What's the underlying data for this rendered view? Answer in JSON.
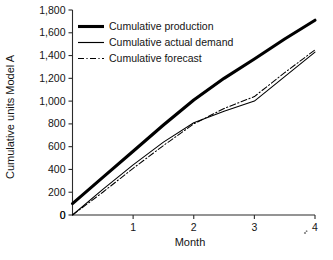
{
  "chart_data": {
    "type": "line",
    "title": "",
    "subtitle": "",
    "xlabel": "Month",
    "ylabel": "Cumulative units Model A",
    "xlim": [
      0,
      4
    ],
    "ylim": [
      0,
      1800
    ],
    "grid": false,
    "legend_position": "top-left-inside",
    "x_ticks": [
      0,
      1,
      2,
      3,
      4
    ],
    "x_tick_labels": [
      "0",
      "1",
      "2",
      "3",
      "4"
    ],
    "y_ticks": [
      0,
      200,
      400,
      600,
      800,
      1000,
      1200,
      1400,
      1600,
      1800
    ],
    "y_tick_labels": [
      "0",
      "200",
      "400",
      "600",
      "800",
      "1,000",
      "1,200",
      "1,400",
      "1,600",
      "1,800"
    ],
    "x": [
      0,
      0.5,
      1,
      1.5,
      2,
      2.5,
      3,
      3.5,
      4
    ],
    "series": [
      {
        "name": "Cumulative production",
        "style": "thick-solid",
        "color": "#000000",
        "values": [
          100,
          330,
          560,
          790,
          1010,
          1200,
          1370,
          1545,
          1710
        ]
      },
      {
        "name": "Cumulative actual demand",
        "style": "thin-solid",
        "color": "#000000",
        "values": [
          0,
          225,
          440,
          640,
          810,
          910,
          1000,
          1215,
          1430
        ]
      },
      {
        "name": "Cumulative forecast",
        "style": "dash-dot",
        "color": "#000000",
        "values": [
          0,
          200,
          410,
          610,
          800,
          935,
          1040,
          1250,
          1450
        ]
      }
    ]
  },
  "legend": {
    "items": [
      {
        "label": "Cumulative production",
        "style": "thick-solid"
      },
      {
        "label": "Cumulative actual demand",
        "style": "thin-solid"
      },
      {
        "label": "Cumulative forecast",
        "style": "dash-dot"
      }
    ]
  },
  "axes": {
    "y_title": "Cumulative units Model A",
    "x_title": "Month"
  }
}
